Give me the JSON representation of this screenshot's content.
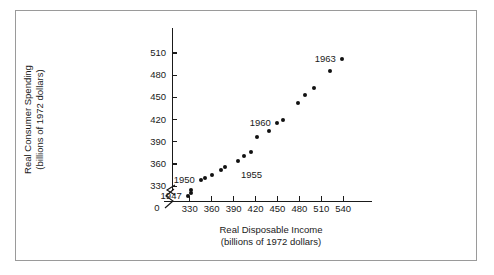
{
  "chart_data": {
    "type": "scatter",
    "title": "",
    "xlabel": "Real Disposable Income",
    "xlabel_sub": "(billions of 1972 dollars)",
    "ylabel": "Real Consumer Spending",
    "ylabel_sub": "(billions of 1972 dollars)",
    "xlim": [
      318,
      552
    ],
    "ylim": [
      310,
      522
    ],
    "grid": false,
    "legend": null,
    "axis_break_x": true,
    "axis_break_y": true,
    "origin_label": "0",
    "xticks": [
      330,
      360,
      390,
      420,
      450,
      480,
      510,
      540
    ],
    "xtick_labels": [
      "330",
      "360",
      "390",
      "420",
      "450",
      "480",
      "510",
      "540"
    ],
    "yticks": [
      330,
      360,
      390,
      420,
      450,
      480,
      510
    ],
    "ytick_labels": [
      "330",
      "360",
      "390",
      "420",
      "450",
      "480",
      "510"
    ],
    "series": [
      {
        "name": "Consumption vs Income 1947-1963",
        "marker": "filled-circle",
        "color": "#111111",
        "points": [
          {
            "year": 1947,
            "x": 327,
            "y": 317
          },
          {
            "year": 1948,
            "x": 332,
            "y": 321
          },
          {
            "year": 1949,
            "x": 332,
            "y": 325
          },
          {
            "year": 1950,
            "x": 345,
            "y": 338
          },
          {
            "year": 1951,
            "x": 351,
            "y": 341
          },
          {
            "year": 1952,
            "x": 360,
            "y": 345
          },
          {
            "year": 1953,
            "x": 373,
            "y": 352
          },
          {
            "year": 1954,
            "x": 378,
            "y": 356
          },
          {
            "year": 1955,
            "x": 396,
            "y": 364
          },
          {
            "year": 1956,
            "x": 404,
            "y": 371
          },
          {
            "year": 1957,
            "x": 414,
            "y": 376
          },
          {
            "year": 1958,
            "x": 422,
            "y": 396
          },
          {
            "year": 1959,
            "x": 439,
            "y": 405
          },
          {
            "year": 1960,
            "x": 449,
            "y": 415
          },
          {
            "year": 1961,
            "x": 457,
            "y": 419
          },
          {
            "year": 1962,
            "x": 478,
            "y": 443
          },
          {
            "year": 1963,
            "x": 487,
            "y": 453
          },
          {
            "year": 1964,
            "x": 500,
            "y": 463
          },
          {
            "year": 1965,
            "x": 522,
            "y": 485
          },
          {
            "year": 1966,
            "x": 538,
            "y": 502
          }
        ]
      }
    ],
    "annotations": [
      {
        "label": "1947",
        "x": 327,
        "y": 317,
        "position": "left"
      },
      {
        "label": "1950",
        "x": 345,
        "y": 338,
        "position": "left"
      },
      {
        "label": "1955",
        "x": 396,
        "y": 364,
        "position": "below-right"
      },
      {
        "label": "1960",
        "x": 449,
        "y": 415,
        "position": "left"
      },
      {
        "label": "1963",
        "x": 538,
        "y": 502,
        "position": "left"
      }
    ]
  },
  "figure": {
    "frame_color": "#9a9a9a",
    "background": "#ffffff",
    "ink_color": "#1a1a1a",
    "marker_color": "#111111"
  }
}
